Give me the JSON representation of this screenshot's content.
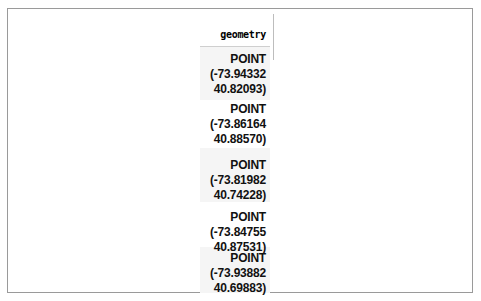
{
  "table": {
    "header": "geometry",
    "rows": [
      {
        "type": "POINT",
        "lon": "(-73.94332",
        "lat": "40.82093)"
      },
      {
        "type": "POINT",
        "lon": "(-73.86164",
        "lat": "40.88570)"
      },
      {
        "type": "POINT",
        "lon": "(-73.81982",
        "lat": "40.74228)"
      },
      {
        "type": "POINT",
        "lon": "(-73.84755",
        "lat": "40.87531)"
      },
      {
        "type": "POINT",
        "lon": "(-73.93882",
        "lat": "40.69883)"
      }
    ]
  },
  "colors": {
    "frame_border": "#9a9a9a",
    "row_shade": "#f5f5f5",
    "text": "#111111"
  }
}
